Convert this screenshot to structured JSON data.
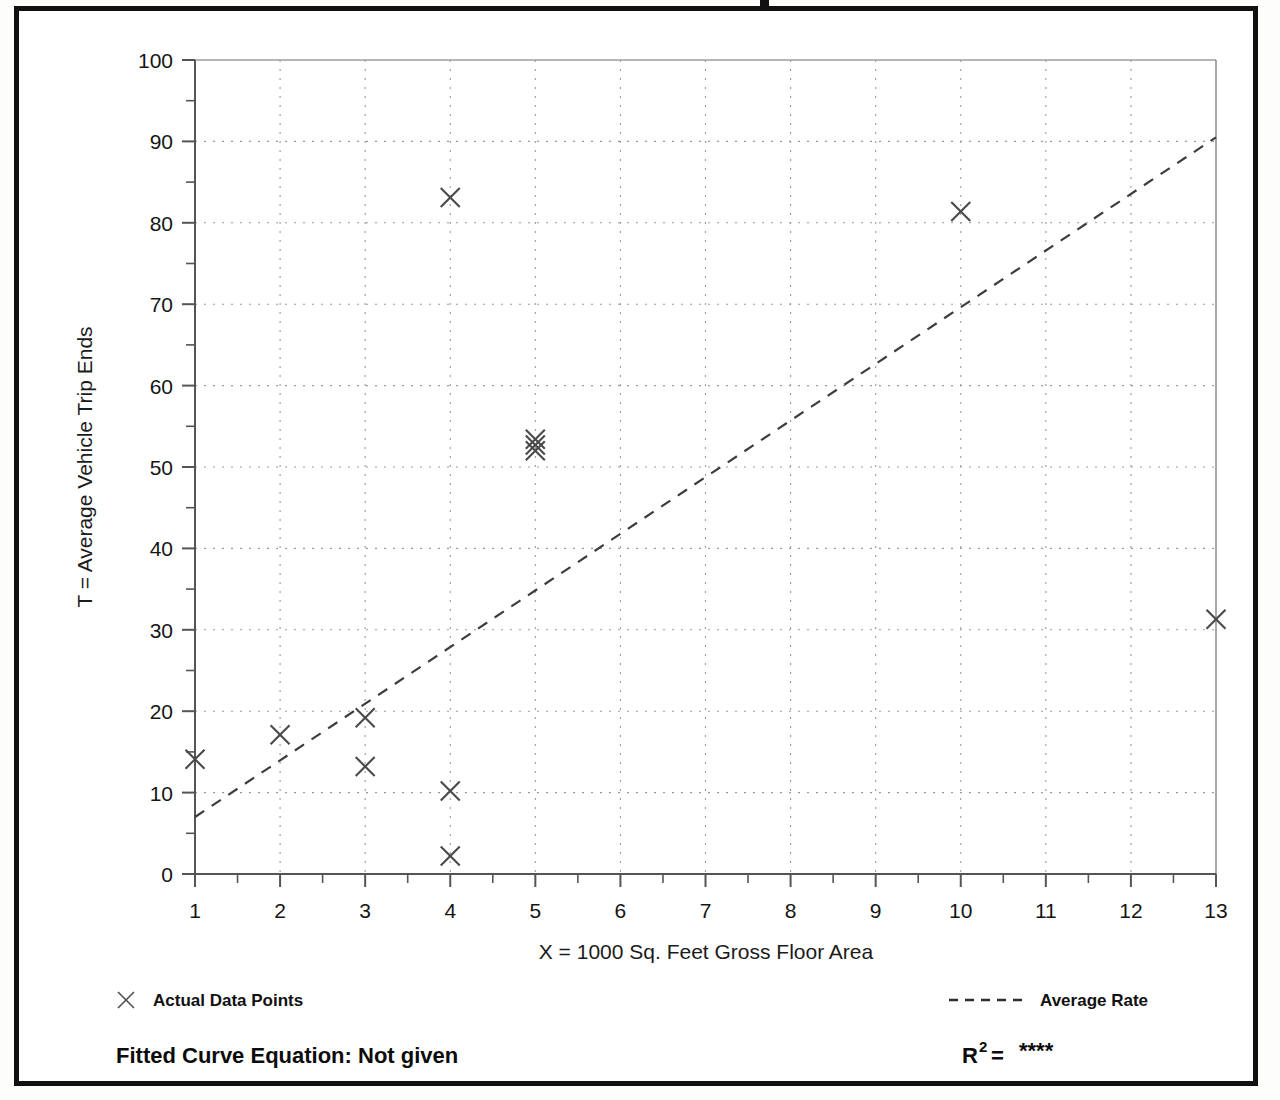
{
  "chart_data": {
    "type": "scatter",
    "title": "",
    "xlabel": "X = 1000 Sq. Feet Gross Floor Area",
    "ylabel": "T = Average Vehicle Trip Ends",
    "xlim": [
      1,
      13
    ],
    "ylim": [
      0,
      100
    ],
    "xticks": [
      1,
      2,
      3,
      4,
      5,
      6,
      7,
      8,
      9,
      10,
      11,
      12,
      13
    ],
    "yticks": [
      0,
      10,
      20,
      30,
      40,
      50,
      60,
      70,
      80,
      90,
      100
    ],
    "y_minor_ticks": [
      5,
      15,
      25,
      35,
      45,
      55,
      65,
      75,
      85,
      95
    ],
    "xtick_labels": [
      "1",
      "2",
      "3",
      "4",
      "5",
      "6",
      "7",
      "8",
      "9",
      "10",
      "11",
      "12",
      "13"
    ],
    "ytick_labels": [
      "0",
      "10",
      "20",
      "30",
      "40",
      "50",
      "60",
      "70",
      "80",
      "90",
      "100"
    ],
    "grid": true,
    "grid_style": "dotted",
    "legend_position": "below-plot",
    "series": [
      {
        "name": "Actual Data Points",
        "type": "scatter",
        "marker": "x",
        "color": "#4a4a4a",
        "points": [
          {
            "x": 1,
            "y": 14.1
          },
          {
            "x": 2,
            "y": 17.1
          },
          {
            "x": 3,
            "y": 19.2
          },
          {
            "x": 3,
            "y": 13.2
          },
          {
            "x": 4,
            "y": 83.1
          },
          {
            "x": 4,
            "y": 10.2
          },
          {
            "x": 4,
            "y": 2.2
          },
          {
            "x": 5,
            "y": 53.4
          },
          {
            "x": 5,
            "y": 52.7
          },
          {
            "x": 5,
            "y": 52.0
          },
          {
            "x": 10,
            "y": 81.4
          },
          {
            "x": 13,
            "y": 31.3
          }
        ]
      },
      {
        "name": "Average Rate",
        "type": "line",
        "style": "dashed",
        "color": "#3d3d3d",
        "endpoints": [
          {
            "x": 1,
            "y": 7.0
          },
          {
            "x": 13,
            "y": 90.5
          }
        ]
      }
    ],
    "annotations": {
      "fitted_curve_equation": "Fitted Curve Equation:  Not given",
      "r_squared_label": "R",
      "r_squared_exponent": "2",
      "r_squared_equals": " = ",
      "r_squared_value": "****"
    }
  },
  "legend": {
    "data_points_label": "Actual Data Points",
    "average_rate_label": "Average Rate",
    "marker_icon": "x-marker-icon",
    "line_icon": "dashed-line-icon"
  },
  "footer": {
    "equation_text": "Fitted Curve Equation:  Not given",
    "r2_prefix": "R",
    "r2_sup": "2",
    "r2_mid": " = ",
    "r2_value": "****"
  },
  "colors": {
    "frame": "#111111",
    "axis": "#555555",
    "grid": "#9a9a9a",
    "marker": "#4a4a4a",
    "trendline": "#3d3d3d",
    "text": "#111111",
    "background": "#ffffff"
  }
}
